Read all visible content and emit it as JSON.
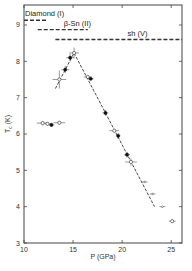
{
  "chart_data": {
    "type": "scatter",
    "title": "",
    "xlabel": "P  (GPa)",
    "ylabel": "T_c (K)",
    "xlim": [
      10,
      26.1
    ],
    "ylim": [
      3,
      9.55
    ],
    "xticks": [
      10,
      15,
      20,
      25
    ],
    "yticks": [
      3,
      4,
      5,
      6,
      7,
      8,
      9
    ],
    "grid": false,
    "phase_lines": [
      {
        "name": "Diamond (I)",
        "x": [
          10.0,
          12.4
        ],
        "y": 9.13,
        "style": "dashed"
      },
      {
        "name": "β-Sn (II)",
        "x": [
          11.4,
          16.5
        ],
        "y": 8.87,
        "style": "dashed"
      },
      {
        "name": "sh (V)",
        "x": [
          13.2,
          26.1
        ],
        "y": 8.6,
        "style": "dashed"
      }
    ],
    "trend_lines": [
      {
        "name": "rising",
        "x": [
          13.2,
          15.1
        ],
        "y": [
          7.25,
          8.23
        ],
        "style": "dashed"
      },
      {
        "name": "falling",
        "x": [
          15.1,
          23.3
        ],
        "y": [
          8.23,
          4.0
        ],
        "style": "dashed"
      }
    ],
    "series": [
      {
        "name": "open markers",
        "marker": "open",
        "points": [
          {
            "x": 11.9,
            "y": 6.3,
            "xerr": 0.6,
            "yerr": 0.06
          },
          {
            "x": 12.4,
            "y": 6.28,
            "xerr": 0.3,
            "yerr": 0.05
          },
          {
            "x": 13.6,
            "y": 6.31,
            "xerr": 0.6,
            "yerr": 0.05
          },
          {
            "x": 13.6,
            "y": 7.5,
            "xerr": 0.7,
            "yerr": 0.25
          },
          {
            "x": 15.1,
            "y": 8.23,
            "xerr": 0.5,
            "yerr": 0.15
          },
          {
            "x": 16.5,
            "y": 7.57,
            "xerr": 0.4,
            "yerr": 0.05
          },
          {
            "x": 19.2,
            "y": 6.09,
            "xerr": 0.5,
            "yerr": 0.05
          },
          {
            "x": 20.9,
            "y": 5.23,
            "xerr": 0.6,
            "yerr": 0.1
          },
          {
            "x": 25.1,
            "y": 3.6,
            "xerr": 0.35,
            "yerr": 0.05
          }
        ]
      },
      {
        "name": "filled markers",
        "marker": "filled",
        "points": [
          {
            "x": 12.8,
            "y": 6.25,
            "xerr": 0.3,
            "yerr": 0.05
          },
          {
            "x": 14.2,
            "y": 7.77,
            "xerr": 0.4,
            "yerr": 0.1
          },
          {
            "x": 14.7,
            "y": 8.1,
            "xerr": 0.4,
            "yerr": 0.1
          },
          {
            "x": 16.8,
            "y": 7.52,
            "xerr": 0.3,
            "yerr": 0.05
          },
          {
            "x": 18.3,
            "y": 6.58,
            "xerr": 0.3,
            "yerr": 0.08
          },
          {
            "x": 19.6,
            "y": 5.95,
            "xerr": 0.2,
            "yerr": 0.08
          },
          {
            "x": 20.5,
            "y": 5.43,
            "xerr": 0.3,
            "yerr": 0.08
          }
        ]
      },
      {
        "name": "small markers",
        "marker": "small",
        "points": [
          {
            "x": 22.3,
            "y": 4.68,
            "xerr": 0.3,
            "yerr": 0.02
          },
          {
            "x": 23.1,
            "y": 4.35,
            "xerr": 0.3,
            "yerr": 0.02
          },
          {
            "x": 24.1,
            "y": 4.0,
            "xerr": 0.3,
            "yerr": 0.02
          }
        ]
      }
    ]
  }
}
